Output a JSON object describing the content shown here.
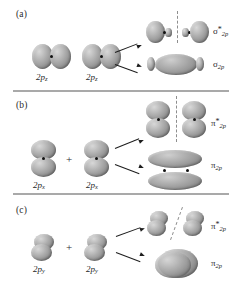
{
  "figure": {
    "panels": [
      {
        "id": "a",
        "label": "(a)",
        "atomic_orbitals": [
          {
            "label_base": "2p",
            "subscript": "z"
          },
          {
            "label_base": "2p",
            "subscript": "z"
          }
        ],
        "operator": "",
        "molecular_orbitals": [
          {
            "symbol": "σ",
            "star": "*",
            "subscript": "2p",
            "type": "antibonding",
            "nodal_plane": "vertical-dashed"
          },
          {
            "symbol": "σ",
            "star": "",
            "subscript": "2p",
            "type": "bonding",
            "nodal_plane": "none"
          }
        ]
      },
      {
        "id": "b",
        "label": "(b)",
        "atomic_orbitals": [
          {
            "label_base": "2p",
            "subscript": "x"
          },
          {
            "label_base": "2p",
            "subscript": "x"
          }
        ],
        "operator": "+",
        "molecular_orbitals": [
          {
            "symbol": "π",
            "star": "*",
            "subscript": "2p",
            "type": "antibonding",
            "nodal_plane": "vertical-dashed"
          },
          {
            "symbol": "π",
            "star": "",
            "subscript": "2p",
            "type": "bonding",
            "nodal_plane": "none"
          }
        ]
      },
      {
        "id": "c",
        "label": "(c)",
        "atomic_orbitals": [
          {
            "label_base": "2p",
            "subscript": "y"
          },
          {
            "label_base": "2p",
            "subscript": "y"
          }
        ],
        "operator": "+",
        "molecular_orbitals": [
          {
            "symbol": "π",
            "star": "*",
            "subscript": "2p",
            "type": "antibonding",
            "nodal_plane": "diagonal-dashed"
          },
          {
            "symbol": "π",
            "star": "",
            "subscript": "2p",
            "type": "bonding",
            "nodal_plane": "none"
          }
        ]
      }
    ],
    "colors": {
      "lobe_light": "#d8d8d8",
      "lobe_mid": "#9d9d9d",
      "lobe_dark": "#6d6d6d",
      "nucleus": "#111111",
      "nodal_line": "#8e8e8e",
      "rule": "#a9a9a9",
      "text": "#1f1f1f",
      "background": "#ffffff"
    }
  }
}
